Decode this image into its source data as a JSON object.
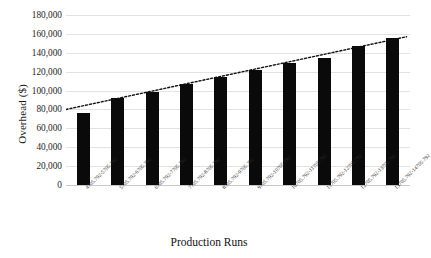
{
  "chart_data": {
    "type": "bar",
    "title": "",
    "xlabel": "Production Runs",
    "ylabel": "Overhead ($)",
    "ylim": [
      0,
      180000
    ],
    "ytick_step": 20000,
    "ytick_labels": [
      "180,000",
      "160,000",
      "140,000",
      "120,000",
      "100,000",
      "80,000",
      "60,000",
      "40,000",
      "20,000",
      "0"
    ],
    "ytick_values": [
      180000,
      160000,
      140000,
      120000,
      100000,
      80000,
      60000,
      40000,
      20000,
      0
    ],
    "grid": true,
    "legend": false,
    "categories": [
      "4705.792-5705.792",
      "5705.792-6705.792",
      "6705.792-7705.792",
      "7705.792-8705.792",
      "8705.792-9705.792",
      "9705.792-10705.792",
      "10705.792-11705.792",
      "11705.792-12705.792",
      "12705.792-13705.792",
      "13705.792-14705.792"
    ],
    "values": [
      76000,
      92000,
      99000,
      107000,
      114000,
      122000,
      129000,
      135000,
      147000,
      156000
    ],
    "bar_color": "#0a0a0a",
    "annotations": [
      {
        "name": "linear-trendline",
        "style": "dotted",
        "color": "#111111",
        "start_value": 80000,
        "end_value": 157000
      }
    ]
  }
}
